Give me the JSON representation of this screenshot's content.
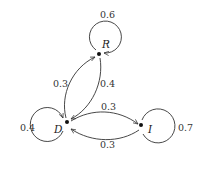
{
  "diagram": {
    "type": "markov-chain-state-diagram",
    "nodes": [
      {
        "id": "R",
        "label": "R",
        "self_loop": "0.6"
      },
      {
        "id": "D",
        "label": "D",
        "self_loop": "0.4"
      },
      {
        "id": "I",
        "label": "I",
        "self_loop": "0.7"
      }
    ],
    "edges": [
      {
        "from": "R",
        "to": "R",
        "label": "0.6"
      },
      {
        "from": "D",
        "to": "R",
        "label": "0.3"
      },
      {
        "from": "R",
        "to": "D",
        "label": "0.4"
      },
      {
        "from": "D",
        "to": "D",
        "label": "0.4"
      },
      {
        "from": "D",
        "to": "I",
        "label": "0.3"
      },
      {
        "from": "I",
        "to": "D",
        "label": "0.3"
      },
      {
        "from": "I",
        "to": "I",
        "label": "0.7"
      }
    ],
    "colors": {
      "stroke": "#333333",
      "background": "#ffffff"
    }
  }
}
